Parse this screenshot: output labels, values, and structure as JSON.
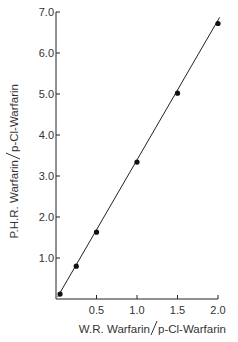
{
  "chart_data": {
    "type": "scatter",
    "title": "",
    "xlabel": "W.R. Warfarin / p-Cl-Warfarin",
    "ylabel": "P.H.R. Warfarin / p-Cl-Warfarin",
    "xlim": [
      0,
      2.0
    ],
    "ylim": [
      0,
      7.0
    ],
    "grid": false,
    "legend": null,
    "x_ticks": [
      "0.5",
      "1.0",
      "1.5",
      "2.0"
    ],
    "y_ticks": [
      "1.0",
      "2.0",
      "3.0",
      "4.0",
      "5.0",
      "6.0",
      "7.0"
    ],
    "series": [
      {
        "name": "data",
        "marker": "filled-circle",
        "x": [
          0.05,
          0.25,
          0.5,
          1.0,
          1.5,
          2.0
        ],
        "y": [
          0.12,
          0.8,
          1.63,
          3.34,
          5.02,
          6.72
        ]
      }
    ],
    "fit_line": {
      "style": "solid",
      "from": [
        0.02,
        0.05
      ],
      "to": [
        2.02,
        6.87
      ]
    }
  },
  "labels": {
    "xlabel_left": "W.R. Warfarin",
    "xlabel_right": "p-Cl-Warfarin",
    "ylabel_left": "P.H.R. Warfarin",
    "ylabel_right": "p-Cl-Warfarin"
  },
  "colors": {
    "ink": "#111111",
    "text": "#333333",
    "background": "#ffffff"
  }
}
